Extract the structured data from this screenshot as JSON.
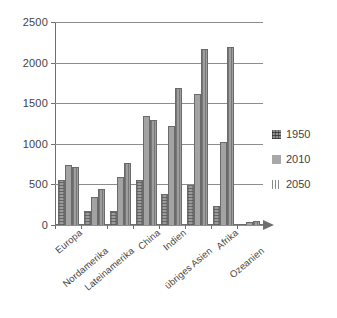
{
  "chart_data": {
    "type": "bar",
    "title": "",
    "subtitle": "",
    "xlabel": "",
    "ylabel": "",
    "ylim": [
      0,
      2500
    ],
    "yticks": [
      0,
      500,
      1000,
      1500,
      2000,
      2500
    ],
    "grid": true,
    "legend_position": "right",
    "categories": [
      "Europa",
      "Nordamerika",
      "Lateinamerika",
      "China",
      "Indien",
      "übriges Asien",
      "Afrika",
      "Ozeanien"
    ],
    "series": [
      {
        "name": "1950",
        "pattern": "cross-hatch",
        "values": [
          549,
          172,
          168,
          551,
          376,
          487,
          229,
          13
        ]
      },
      {
        "name": "2010",
        "pattern": "solid",
        "values": [
          738,
          345,
          597,
          1341,
          1225,
          1609,
          1022,
          37
        ]
      },
      {
        "name": "2050",
        "pattern": "vertical-lines",
        "values": [
          719,
          447,
          759,
          1296,
          1692,
          2164,
          2192,
          55
        ]
      }
    ]
  },
  "axis": {
    "y_tick_labels": [
      "2500",
      "2000",
      "1500",
      "1000",
      "500",
      "0"
    ]
  },
  "legend": {
    "items": [
      {
        "label": "1950",
        "swatch": "hatch-swatch-1950"
      },
      {
        "label": "2010",
        "swatch": "solid-swatch-2010"
      },
      {
        "label": "2050",
        "swatch": "lines-swatch-2050"
      }
    ]
  }
}
